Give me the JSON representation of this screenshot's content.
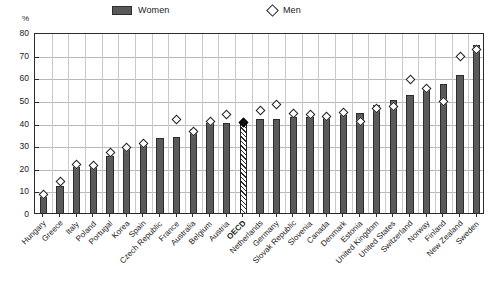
{
  "legend": {
    "women": {
      "label": "Women",
      "icon": "filled-bar-swatch",
      "color": "#5a5a5a"
    },
    "men": {
      "label": "Men",
      "icon": "open-diamond-swatch",
      "color": "#ffffff"
    }
  },
  "axis": {
    "unit": "%",
    "y_ticks": [
      "0",
      "10",
      "20",
      "30",
      "40",
      "50",
      "60",
      "70",
      "80"
    ]
  },
  "chart_data": {
    "type": "bar",
    "title": "",
    "subtitle": "",
    "xlabel": "",
    "ylabel": "%",
    "ylim": [
      0,
      80
    ],
    "ytick_step": 10,
    "grid": true,
    "legend_position": "top",
    "highlight_category": "OECD",
    "highlight_style": "hatched-bar-with-filled-diamond",
    "categories": [
      "Hungary",
      "Greece",
      "Italy",
      "Poland",
      "Portugal",
      "Korea",
      "Spain",
      "Czech Republic",
      "France",
      "Australia",
      "Belgium",
      "Austria",
      "OECD",
      "Netherlands",
      "Germany",
      "Slovak Republic",
      "Slovenia",
      "Canada",
      "Denmark",
      "Estonia",
      "United Kingdom",
      "United States",
      "Switzerland",
      "Norway",
      "Finland",
      "New Zealand",
      "Sweden"
    ],
    "series": [
      {
        "name": "Women",
        "type": "bar",
        "values": [
          8,
          13,
          21,
          21.5,
          26,
          29.5,
          31,
          34,
          34.5,
          38,
          40.5,
          40.5,
          41,
          42.5,
          42.5,
          43.5,
          43.5,
          43.5,
          44,
          45,
          48.5,
          51,
          53,
          55.5,
          58,
          62,
          75
        ]
      },
      {
        "name": "Men",
        "type": "scatter",
        "marker": "diamond",
        "values": [
          9,
          15,
          22.5,
          22,
          27.5,
          30,
          31.5,
          null,
          42,
          37,
          41.5,
          44.5,
          41,
          46,
          49,
          45,
          44.5,
          43.5,
          45.5,
          41.5,
          47,
          48,
          60,
          56,
          50,
          70,
          73
        ]
      }
    ]
  }
}
